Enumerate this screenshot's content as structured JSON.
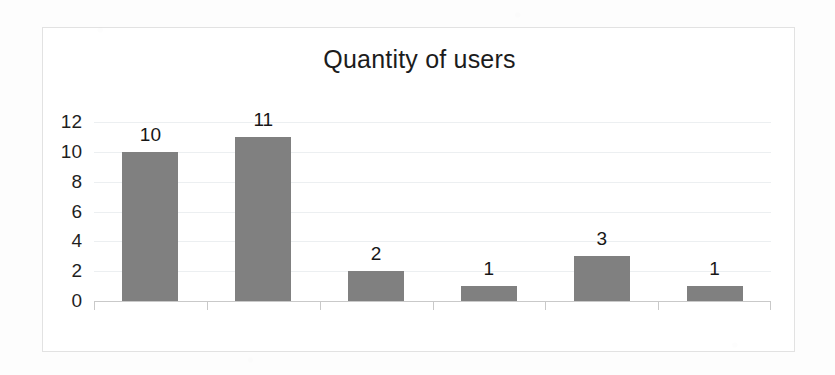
{
  "chart_data": {
    "type": "bar",
    "title": "Quantity of users",
    "xlabel": "",
    "ylabel": "",
    "categories": [
      "3 to 7 users",
      "8 to 12 users",
      "13 to 17",
      "18 to 22",
      "23 to 27",
      "33 to 38"
    ],
    "values": [
      10,
      11,
      2,
      1,
      3,
      1
    ],
    "data_labels": [
      "10",
      "11",
      "2",
      "1",
      "3",
      "1"
    ],
    "ylim": [
      0,
      12
    ],
    "ytick_labels": [
      "0",
      "2",
      "4",
      "6",
      "8",
      "10",
      "12"
    ],
    "ytick_values": [
      0,
      2,
      4,
      6,
      8,
      10,
      12
    ],
    "grid": true,
    "grid_axis": "y",
    "legend": false,
    "legend_position": "none",
    "bar_color": "#808080",
    "gridline_color": "#eceff1",
    "axis_color": "#c9c9c9",
    "text_color": "#1c1c1c",
    "plot_background": "#ffffff",
    "frame_border_color": "#e2e2e2"
  }
}
